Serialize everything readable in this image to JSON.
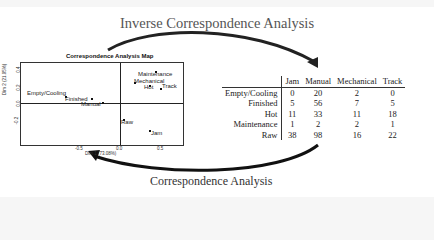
{
  "diagram": {
    "top_label": "Inverse Correspondence Analysis",
    "bottom_label": "Correspondence Analysis"
  },
  "map": {
    "title": "Correspondence Analysis Map",
    "xlabel": "Dim 1 (73.08%)",
    "ylabel": "Dim 2 (21.95%)",
    "xticks": [
      "-0.5",
      "0.0",
      "0.5"
    ],
    "yticks": [
      "0.4",
      "0.2",
      "0.0",
      "-0.2"
    ],
    "points": [
      {
        "label": "Empty/Cooling",
        "x": -0.68,
        "y": 0.14
      },
      {
        "label": "Finished",
        "x": -0.35,
        "y": 0.09
      },
      {
        "label": "Manual",
        "x": -0.22,
        "y": 0.0
      },
      {
        "label": "Maintenance",
        "x": 0.43,
        "y": 0.38
      },
      {
        "label": "Mechanical",
        "x": 0.18,
        "y": 0.26
      },
      {
        "label": "Hot",
        "x": 0.3,
        "y": 0.2
      },
      {
        "label": "Track",
        "x": 0.48,
        "y": 0.21
      },
      {
        "label": "Raw",
        "x": 0.03,
        "y": -0.2
      },
      {
        "label": "Jam",
        "x": 0.35,
        "y": -0.33
      }
    ]
  },
  "table": {
    "columns": [
      "Jam",
      "Manual",
      "Mechanical",
      "Track"
    ],
    "rows": [
      {
        "label": "Empty/Cooling",
        "values": [
          "0",
          "20",
          "2",
          "0"
        ]
      },
      {
        "label": "Finished",
        "values": [
          "5",
          "56",
          "7",
          "5"
        ]
      },
      {
        "label": "Hot",
        "values": [
          "11",
          "33",
          "11",
          "18"
        ]
      },
      {
        "label": "Maintenance",
        "values": [
          "1",
          "2",
          "2",
          "1"
        ]
      },
      {
        "label": "Raw",
        "values": [
          "38",
          "98",
          "16",
          "22"
        ]
      }
    ]
  }
}
